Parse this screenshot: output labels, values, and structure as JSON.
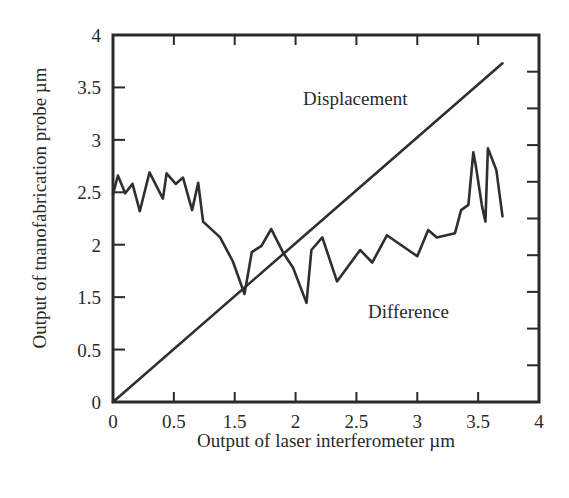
{
  "chart_data": {
    "type": "line",
    "title": "",
    "xlabel": "Output of laser interferometer µm",
    "ylabel": "Output of tnanofabrication probe µm",
    "xlim": [
      0,
      4
    ],
    "ylim": [
      0,
      4
    ],
    "x_tick_labels": [
      "0",
      "0.5",
      "1.5",
      "2",
      "2.5",
      "3",
      "3.5",
      "4"
    ],
    "y_tick_labels": [
      "0",
      "0.5",
      "1.5",
      "2",
      "2.5",
      "3",
      "3.5",
      "4"
    ],
    "grid": false,
    "legend": "none (series labeled by inline annotations)",
    "annotations": [
      {
        "text": "Displacement",
        "series": "Displacement"
      },
      {
        "text": "Difference",
        "series": "Difference"
      }
    ],
    "series": [
      {
        "name": "Displacement",
        "x": [
          0,
          3.7
        ],
        "y": [
          0,
          3.73
        ]
      },
      {
        "name": "Difference",
        "x": [
          0,
          0.04,
          0.1,
          0.16,
          0.22,
          0.3,
          0.41,
          0.44,
          0.53,
          0.65,
          0.8,
          0.9,
          0.98,
          1.26,
          1.47,
          1.58,
          1.64,
          1.72,
          1.8,
          1.9,
          1.98,
          2.09,
          2.13,
          2.22,
          2.34,
          2.53,
          2.63,
          2.75,
          3.0,
          3.09,
          3.16,
          3.31,
          3.36,
          3.42,
          3.46,
          3.48,
          3.53,
          3.56,
          3.58,
          3.65,
          3.7
        ],
        "y": [
          2.48,
          2.66,
          2.49,
          2.58,
          2.32,
          2.69,
          2.44,
          2.68,
          2.58,
          2.64,
          2.33,
          2.59,
          2.22,
          2.07,
          1.84,
          1.53,
          1.93,
          1.99,
          2.15,
          1.92,
          1.78,
          1.39,
          1.95,
          2.07,
          1.65,
          1.95,
          1.83,
          2.09,
          1.89,
          2.14,
          2.07,
          2.11,
          2.33,
          2.38,
          2.88,
          2.76,
          2.38,
          2.22,
          2.92,
          2.71,
          2.27
        ]
      }
    ]
  },
  "chart_area": {
    "left_px": 113,
    "right_px": 539,
    "top_px": 35,
    "bottom_px": 402,
    "top_tick_count": 6,
    "right_tick_count": 9
  },
  "colors": {
    "line": "#2f2f2f",
    "axes": "#2a2a2a",
    "background": "#ffffff"
  }
}
